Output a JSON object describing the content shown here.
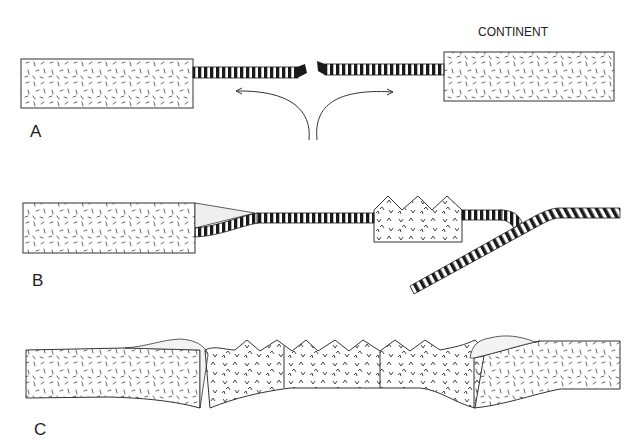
{
  "diagram": {
    "labels": {
      "continent": "CONTINENT",
      "panel_a": "A",
      "panel_b": "B",
      "panel_c": "C"
    },
    "panels": [
      {
        "id": "A",
        "description": "Rifting: two continental blocks separated by oceanic crust, divergent arrows at spreading center"
      },
      {
        "id": "B",
        "description": "Subduction: oceanic slab descending beneath island arc, sediment wedge at left continental margin"
      },
      {
        "id": "C",
        "description": "Collision: island arc volcanic material compressed between two continental blocks"
      }
    ],
    "legend": {
      "continental_crust": "dash pattern (granitic)",
      "oceanic_crust": "black-and-white striped bar",
      "volcanic_arc": "v-mark pattern (volcanic)",
      "sediment": "stippled wedge"
    },
    "colors": {
      "line": "#333333",
      "stripe_dark": "#1a1a1a",
      "sediment": "#f0f0f0",
      "background": "#ffffff"
    }
  }
}
